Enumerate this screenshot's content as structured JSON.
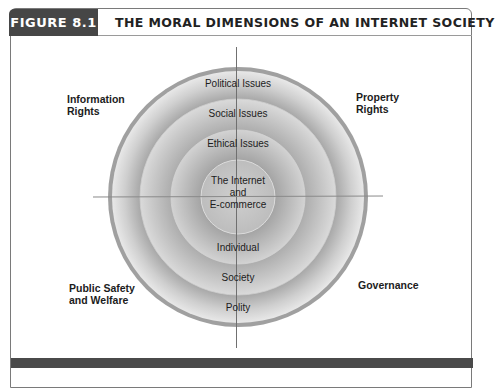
{
  "figure": {
    "label": "FIGURE 8.1",
    "title": "THE MORAL DIMENSIONS OF AN INTERNET SOCIETY"
  },
  "diagram": {
    "rings": {
      "outer_labels": [
        "Political Issues",
        "Polity"
      ],
      "middle_labels": [
        "Social Issues",
        "Society"
      ],
      "inner_labels": [
        "Ethical Issues",
        "Individual"
      ],
      "core_lines": [
        "The Internet",
        "and",
        "E-commerce"
      ]
    },
    "ring_top_labels": {
      "outer": "Political Issues",
      "middle": "Social Issues",
      "inner": "Ethical Issues"
    },
    "ring_bottom_labels": {
      "inner": "Individual",
      "middle": "Society",
      "outer": "Polity"
    },
    "core": {
      "line1": "The Internet",
      "line2": "and",
      "line3": "E-commerce"
    },
    "dimensions": {
      "top_left": {
        "line1": "Information",
        "line2": "Rights"
      },
      "top_right": {
        "line1": "Property",
        "line2": "Rights"
      },
      "bottom_left": {
        "line1": "Public Safety",
        "line2": "and Welfare"
      },
      "bottom_right": {
        "line1": "Governance"
      }
    },
    "colors": {
      "label_bg": "#464646",
      "outer_rim": "#9c9c9c",
      "ring_light": "#e6e6e6",
      "ring_dark": "#a8a8a8",
      "footer_bar": "#4a4a4a"
    }
  }
}
